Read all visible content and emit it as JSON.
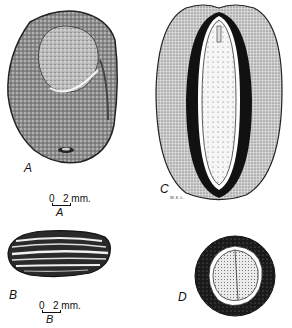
{
  "figure": {
    "panels": [
      {
        "id": "A",
        "label": "A",
        "description": "seed, external view"
      },
      {
        "id": "B",
        "label": "B",
        "description": "seed, ribbed elongated view"
      },
      {
        "id": "C",
        "label": "C",
        "description": "seed, longitudinal section"
      },
      {
        "id": "D",
        "label": "D",
        "description": "seed, cross section"
      }
    ],
    "scale_bars": [
      {
        "id": "A",
        "zero": "0",
        "value": "2 mm.",
        "sub": "A"
      },
      {
        "id": "B",
        "zero": "0",
        "value": "2 mm.",
        "sub": "B"
      }
    ],
    "artist_initials": "W.K.L."
  }
}
